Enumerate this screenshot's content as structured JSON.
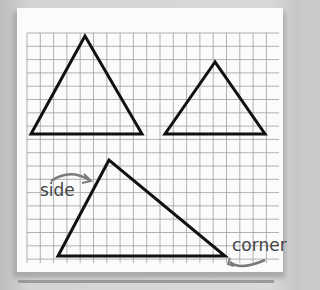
{
  "labels": {
    "side": "side",
    "corner": "corner"
  },
  "colors": {
    "background": "#cfcfcf",
    "paper": "#fbfbfb",
    "grid": "#9a9a9a",
    "shape_stroke": "#111111",
    "annotation": "#7a7a7a"
  },
  "grid": {
    "x0": 27,
    "y0": 33,
    "x1": 279,
    "y1": 263,
    "spacing": 13.3
  },
  "shapes": [
    {
      "name": "triangle-top-left",
      "points": "85,36 31,134 142,134"
    },
    {
      "name": "triangle-top-right",
      "points": "215,62 165,134 265,134"
    },
    {
      "name": "triangle-bottom",
      "points": "109,160 58,256 225,256"
    }
  ]
}
